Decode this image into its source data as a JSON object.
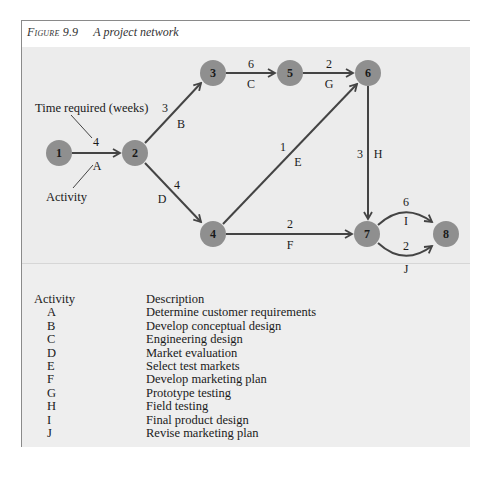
{
  "figure": {
    "label": "Figure 9.9",
    "title": "A project network"
  },
  "colors": {
    "panel_bg": "#ececec",
    "node_fill": "#8f8f8f",
    "edge_stroke": "#444444",
    "text": "#1a1a1a"
  },
  "legend": {
    "time_label": "Time required (weeks)",
    "activity_label": "Activity"
  },
  "network": {
    "nodes": [
      {
        "id": "1",
        "label": "1",
        "x": 59,
        "y": 153
      },
      {
        "id": "2",
        "label": "2",
        "x": 135,
        "y": 153
      },
      {
        "id": "3",
        "label": "3",
        "x": 213,
        "y": 73
      },
      {
        "id": "4",
        "label": "4",
        "x": 213,
        "y": 234
      },
      {
        "id": "5",
        "label": "5",
        "x": 290,
        "y": 73
      },
      {
        "id": "6",
        "label": "6",
        "x": 368,
        "y": 73
      },
      {
        "id": "7",
        "label": "7",
        "x": 367,
        "y": 234
      },
      {
        "id": "8",
        "label": "8",
        "x": 446,
        "y": 234
      }
    ],
    "edges": [
      {
        "activity": "A",
        "from": "1",
        "to": "2",
        "weeks": "4"
      },
      {
        "activity": "B",
        "from": "2",
        "to": "3",
        "weeks": "3"
      },
      {
        "activity": "C",
        "from": "3",
        "to": "5",
        "weeks": "6"
      },
      {
        "activity": "D",
        "from": "2",
        "to": "4",
        "weeks": "4"
      },
      {
        "activity": "E",
        "from": "4",
        "to": "6",
        "weeks": "1"
      },
      {
        "activity": "F",
        "from": "4",
        "to": "7",
        "weeks": "2"
      },
      {
        "activity": "G",
        "from": "5",
        "to": "6",
        "weeks": "2"
      },
      {
        "activity": "H",
        "from": "6",
        "to": "7",
        "weeks": "3"
      },
      {
        "activity": "I",
        "from": "7",
        "to": "8",
        "weeks": "6"
      },
      {
        "activity": "J",
        "from": "7",
        "to": "8",
        "weeks": "2"
      }
    ]
  },
  "table": {
    "headers": {
      "activity": "Activity",
      "description": "Description"
    },
    "rows": [
      {
        "activity": "A",
        "description": "Determine customer requirements"
      },
      {
        "activity": "B",
        "description": "Develop conceptual design"
      },
      {
        "activity": "C",
        "description": "Engineering design"
      },
      {
        "activity": "D",
        "description": "Market evaluation"
      },
      {
        "activity": "E",
        "description": "Select test markets"
      },
      {
        "activity": "F",
        "description": "Develop marketing plan"
      },
      {
        "activity": "G",
        "description": "Prototype testing"
      },
      {
        "activity": "H",
        "description": "Field testing"
      },
      {
        "activity": "I",
        "description": "Final product design"
      },
      {
        "activity": "J",
        "description": "Revise marketing plan"
      }
    ]
  }
}
